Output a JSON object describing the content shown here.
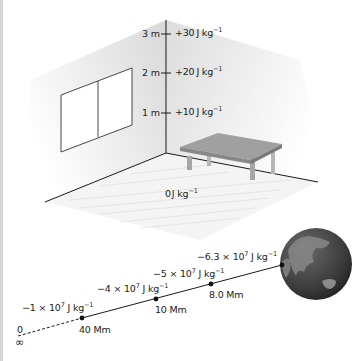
{
  "room": {
    "height_markers": [
      {
        "height": "3 m",
        "potential": "+30",
        "unit": "J kg",
        "exp": "−1"
      },
      {
        "height": "2 m",
        "potential": "+20",
        "unit": "J kg",
        "exp": "−1"
      },
      {
        "height": "1 m",
        "potential": "+10",
        "unit": "J kg",
        "exp": "−1"
      }
    ],
    "floor_label": {
      "value": "0",
      "unit": "J kg",
      "exp": "−1"
    }
  },
  "earth_line": {
    "points": [
      {
        "distance": "8.0 Mm",
        "potential": "−5 × 10",
        "pexp": "7",
        "unit": " J kg",
        "uexp": "−1"
      },
      {
        "distance": "10 Mm",
        "potential": "−4 × 10",
        "pexp": "7",
        "unit": " J kg",
        "uexp": "−1"
      },
      {
        "distance": "40 Mm",
        "potential": "−1 × 10",
        "pexp": "7",
        "unit": " J kg",
        "uexp": "−1"
      }
    ],
    "surface": {
      "potential": "−6.3 × 10",
      "pexp": "7",
      "unit": " J kg",
      "uexp": "−1"
    },
    "infinity": {
      "potential": "0",
      "distance": "∞"
    }
  },
  "colors": {
    "wall": "#e4e4e4",
    "floor": "#f2f2f2",
    "line": "#1a1a1a",
    "table": "#9a9a9a",
    "earth": "#3a3a3a"
  }
}
